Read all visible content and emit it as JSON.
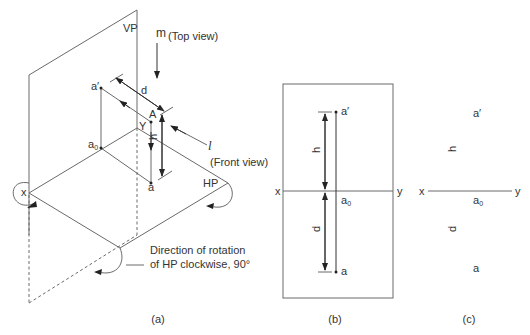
{
  "figure": {
    "panel_a": {
      "caption": "(a)",
      "labels": {
        "vp": "VP",
        "hp": "HP",
        "m": "m",
        "top_view": "(Top view)",
        "l": "l",
        "front_view": "(Front view)",
        "a_prime": "a′",
        "a0_base": "a",
        "a0_sub": "0",
        "point_A": "A",
        "Y": "Y",
        "x": "x",
        "a": "a",
        "d": "d",
        "h": "h"
      },
      "rotation_note": {
        "line1": "Direction of rotation",
        "line2": "of HP clockwise, 90°"
      }
    },
    "panel_b": {
      "caption": "(b)",
      "labels": {
        "x": "x",
        "y": "y",
        "a_prime": "a′",
        "a0_base": "a",
        "a0_sub": "0",
        "a": "a",
        "h": "h",
        "d": "d"
      }
    },
    "panel_c": {
      "caption": "(c)",
      "labels": {
        "x": "x",
        "y": "y",
        "a_prime": "a′",
        "a0_base": "a",
        "a0_sub": "0",
        "a": "a",
        "h": "h",
        "d": "d"
      }
    }
  }
}
